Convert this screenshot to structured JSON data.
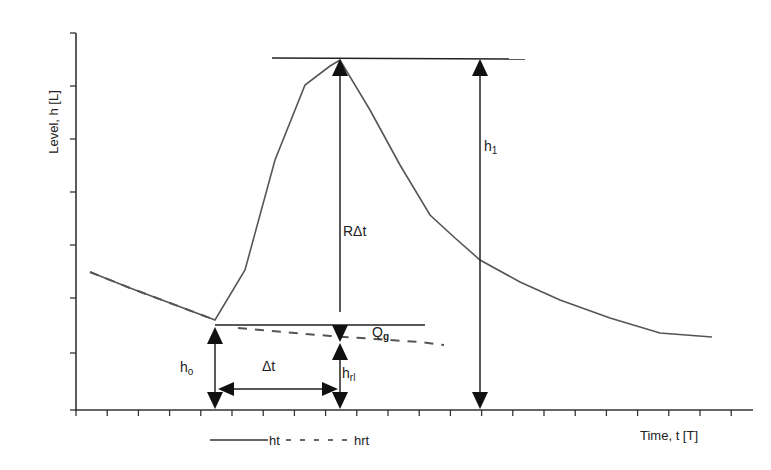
{
  "chart_data": {
    "type": "line",
    "title": "",
    "xlabel": "Time, t [T]",
    "ylabel": "Level, h [L]",
    "grid": false,
    "legend_position": "bottom-left",
    "x_tick_labels": [],
    "y_tick_labels": [],
    "series": [
      {
        "name": "ht",
        "style": "solid",
        "points_px": [
          [
            90,
            272
          ],
          [
            130,
            288
          ],
          [
            170,
            303
          ],
          [
            215,
            320
          ],
          [
            245,
            270
          ],
          [
            275,
            160
          ],
          [
            305,
            85
          ],
          [
            330,
            66
          ],
          [
            340,
            60
          ],
          [
            370,
            110
          ],
          [
            400,
            165
          ],
          [
            430,
            215
          ],
          [
            455,
            238
          ],
          [
            480,
            260
          ],
          [
            520,
            282
          ],
          [
            560,
            300
          ],
          [
            610,
            318
          ],
          [
            660,
            333
          ],
          [
            712,
            337
          ]
        ]
      },
      {
        "name": "hrt",
        "style": "dashed",
        "points_px": [
          [
            90,
            272
          ],
          [
            130,
            288
          ],
          [
            170,
            303
          ],
          [
            215,
            320
          ],
          [
            240,
            328
          ],
          [
            330,
            336
          ],
          [
            420,
            342
          ],
          [
            442,
            345
          ]
        ]
      }
    ],
    "annotations": [
      {
        "label": "h_1",
        "type": "double-arrow",
        "desc": "from time axis up to peak level"
      },
      {
        "label": "RΔt",
        "type": "arrow",
        "desc": "from extrapolated recession to peak"
      },
      {
        "label": "Q_g",
        "desc": "recession (dashed) continuation"
      },
      {
        "label": "h_o",
        "type": "double-arrow",
        "desc": "level before rise"
      },
      {
        "label": "h_rl",
        "type": "double-arrow",
        "desc": "extrapolated recession level at peak time"
      },
      {
        "label": "Δt",
        "type": "double-arrow",
        "desc": "time interval between start of rise and peak"
      }
    ]
  },
  "axes": {
    "y_label": "Level, h [L]",
    "x_label": "Time, t [T]"
  },
  "labels": {
    "h1": "h",
    "h1_sub": "1",
    "r_dt": "RΔt",
    "qg": "Q",
    "qg_sub": "g",
    "ho": "h",
    "ho_sub": "o",
    "hrl": "h",
    "hrl_sub": "rl",
    "dt": "Δt"
  },
  "legend": {
    "items": [
      {
        "label": "ht",
        "style": "solid"
      },
      {
        "label": "hrt",
        "style": "dashed"
      }
    ]
  },
  "colors": {
    "curve": "#555555",
    "axis": "#333333",
    "arrow": "#111111",
    "background": "#ffffff"
  }
}
